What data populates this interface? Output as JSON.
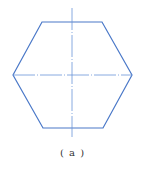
{
  "figure": {
    "shape": "regular-hexagon",
    "stroke_color": "#4a78c8",
    "centerline_color": "#6a94d8",
    "vertices": [
      [
        42,
        22
      ],
      [
        102,
        22
      ],
      [
        132,
        75
      ],
      [
        103,
        128
      ],
      [
        43,
        128
      ],
      [
        13,
        75
      ]
    ],
    "vertical_centerline": {
      "x": 72,
      "y1": 8,
      "y2": 137
    },
    "horizontal_centerline": {
      "y": 75,
      "x1": 13,
      "x2": 132
    }
  },
  "caption": {
    "text": "( a )"
  }
}
